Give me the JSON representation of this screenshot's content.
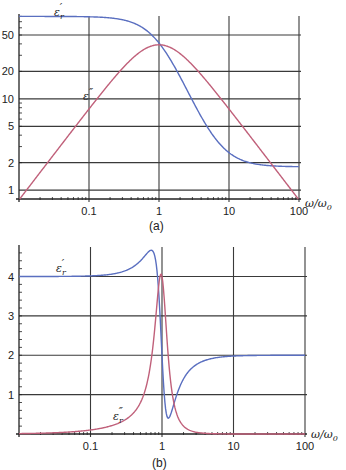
{
  "chart_data": [
    {
      "id": "a",
      "type": "line",
      "panel_label": "(a)",
      "title": "",
      "xlabel": "ω/ω0",
      "ylabel": "",
      "xscale": "log",
      "yscale": "log",
      "xlim": [
        0.01,
        100
      ],
      "ylim": [
        0.8,
        85
      ],
      "x_ticks": [
        0.1,
        1,
        10,
        100
      ],
      "x_tick_labels": [
        "0.1",
        "1",
        "10",
        "100"
      ],
      "y_ticks": [
        1,
        2,
        5,
        10,
        20,
        50
      ],
      "y_tick_labels": [
        "1",
        "2",
        "5",
        "10",
        "20",
        "50"
      ],
      "grid": true,
      "model": "Debye relaxation",
      "series": [
        {
          "name": "ε_r'",
          "color": "#5a6fc0",
          "x": [
            0.01,
            0.1,
            0.3,
            0.5,
            1,
            2,
            3,
            5,
            10,
            20,
            50,
            100
          ],
          "values": [
            80,
            79.2,
            73.4,
            64.2,
            40.9,
            17.4,
            9.6,
            4.8,
            2.6,
            2.0,
            1.83,
            1.81
          ]
        },
        {
          "name": "ε_r''",
          "color": "#c0607a",
          "x": [
            0.01,
            0.03,
            0.1,
            0.3,
            0.5,
            1,
            2,
            3,
            5,
            10,
            30,
            100
          ],
          "values": [
            0.78,
            2.35,
            7.75,
            21.5,
            31.3,
            39.1,
            31.3,
            23.5,
            15.0,
            7.75,
            2.6,
            0.78
          ]
        }
      ],
      "annotations": [
        {
          "text": "ε_r'",
          "near": "top-left above blue curve"
        },
        {
          "text": "ε''",
          "near": "red curve around x=0.08"
        }
      ]
    },
    {
      "id": "b",
      "type": "line",
      "panel_label": "(b)",
      "title": "",
      "xlabel": "ω/ω0",
      "ylabel": "",
      "xscale": "log",
      "yscale": "linear",
      "xlim": [
        0.01,
        100
      ],
      "ylim": [
        0,
        4.8
      ],
      "x_ticks": [
        0.1,
        1,
        10,
        100
      ],
      "x_tick_labels": [
        "0.1",
        "1",
        "10",
        "100"
      ],
      "y_ticks": [
        1,
        2,
        3,
        4
      ],
      "y_tick_labels": [
        "1",
        "2",
        "3",
        "4"
      ],
      "grid": true,
      "model": "Lorentz resonance",
      "series": [
        {
          "name": "ε_r'",
          "color": "#5a6fc0",
          "x": [
            0.01,
            0.1,
            0.3,
            0.5,
            0.7,
            0.8,
            0.9,
            1.0,
            1.1,
            1.2,
            1.5,
            2,
            3,
            5,
            10,
            100
          ],
          "values": [
            4.0,
            4.02,
            4.2,
            4.45,
            4.72,
            4.6,
            3.6,
            2.0,
            0.55,
            0.45,
            1.1,
            1.55,
            1.8,
            1.93,
            1.98,
            2.0
          ]
        },
        {
          "name": "ε_r''",
          "color": "#c0607a",
          "x": [
            0.01,
            0.1,
            0.3,
            0.5,
            0.7,
            0.8,
            0.9,
            1.0,
            1.1,
            1.2,
            1.5,
            2,
            3,
            5,
            10
          ],
          "values": [
            0.02,
            0.1,
            0.3,
            0.6,
            1.3,
            2.1,
            3.7,
            4.1,
            2.2,
            1.1,
            0.35,
            0.15,
            0.05,
            0.02,
            0.0
          ]
        }
      ],
      "annotations": [
        {
          "text": "ε_r'",
          "near": "left, above the 4.0 line"
        },
        {
          "text": "ε_r''",
          "near": "red curve around x=0.3"
        }
      ]
    }
  ],
  "labels": {
    "a": {
      "panel": "(a)",
      "xlabel": "ω/ω",
      "xlabel_sub": "0",
      "curve1_main": "ε",
      "curve1_sub": "r",
      "curve1_prime": "′",
      "curve2_main": "ε",
      "curve2_prime": "″"
    },
    "b": {
      "panel": "(b)",
      "xlabel": "ω/ω",
      "xlabel_sub": "0",
      "curve1_main": "ε",
      "curve1_sub": "r",
      "curve1_prime": "′",
      "curve2_main": "ε",
      "curve2_sub": "r",
      "curve2_prime": "″"
    }
  },
  "colors": {
    "real_part": "#5a6fc0",
    "imag_part": "#c0607a",
    "grid": "#3a3a3a",
    "axis": "#222222"
  }
}
